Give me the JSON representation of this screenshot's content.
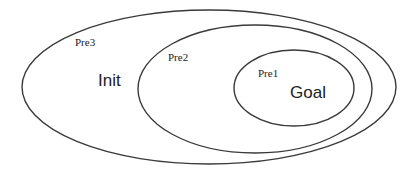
{
  "diagram": {
    "type": "nested-sets",
    "stroke_color": "#3a3a3a",
    "sets": [
      {
        "id": "pre3",
        "label": "Pre3",
        "region_label": "Init"
      },
      {
        "id": "pre2",
        "label": "Pre2",
        "region_label": ""
      },
      {
        "id": "pre1",
        "label": "Pre1",
        "region_label": "Goal"
      }
    ],
    "labels": {
      "pre3": "Pre3",
      "init": "Init",
      "pre2": "Pre2",
      "pre1": "Pre1",
      "goal": "Goal"
    }
  }
}
